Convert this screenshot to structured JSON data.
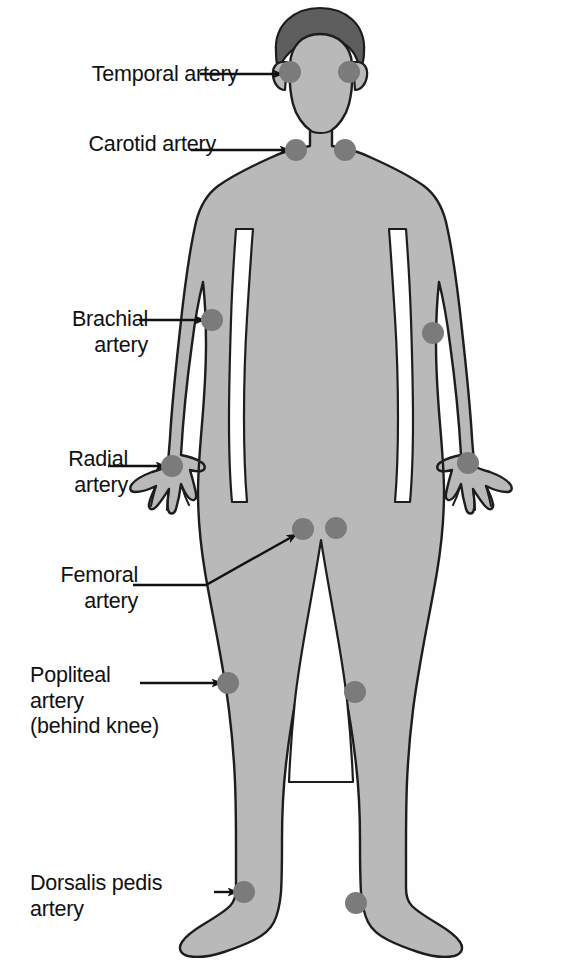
{
  "diagram": {
    "colors": {
      "background": "#fefefe",
      "skin": "#b9b9b9",
      "hair": "#5e5e5e",
      "outline": "#1d1d1d",
      "pulse_dot": "#7b7b7b",
      "text": "#111111",
      "leader_line": "#111111"
    },
    "labels": [
      {
        "id": "temporal",
        "lines": [
          "Temporal artery"
        ],
        "align": "right",
        "x": 30,
        "y": 62,
        "width": 208
      },
      {
        "id": "carotid",
        "lines": [
          "Carotid artery"
        ],
        "align": "right",
        "x": 30,
        "y": 132,
        "width": 186
      },
      {
        "id": "brachial",
        "lines": [
          "Brachial",
          "artery"
        ],
        "align": "right",
        "x": 18,
        "y": 307,
        "width": 130
      },
      {
        "id": "radial",
        "lines": [
          "Radial",
          "artery"
        ],
        "align": "right",
        "x": 18,
        "y": 447,
        "width": 110
      },
      {
        "id": "femoral",
        "lines": [
          "Femoral",
          "artery"
        ],
        "align": "right",
        "x": 18,
        "y": 563,
        "width": 120
      },
      {
        "id": "popliteal",
        "lines": [
          "Popliteal",
          "artery",
          "(behind knee)"
        ],
        "align": "left",
        "x": 30,
        "y": 663,
        "width": 190
      },
      {
        "id": "dorsalis_pedis",
        "lines": [
          "Dorsalis pedis",
          "artery"
        ],
        "align": "left",
        "x": 30,
        "y": 871,
        "width": 200
      }
    ],
    "pulse_points": [
      {
        "name": "temporal-left",
        "side": "left",
        "cx": 290,
        "cy": 72,
        "r": 11
      },
      {
        "name": "temporal-right",
        "side": "right",
        "cx": 349,
        "cy": 72,
        "r": 11
      },
      {
        "name": "carotid-left",
        "side": "left",
        "cx": 296,
        "cy": 150,
        "r": 11
      },
      {
        "name": "carotid-right",
        "side": "right",
        "cx": 345,
        "cy": 150,
        "r": 11
      },
      {
        "name": "brachial-left",
        "side": "left",
        "cx": 212,
        "cy": 320,
        "r": 11
      },
      {
        "name": "brachial-right",
        "side": "right",
        "cx": 433,
        "cy": 333,
        "r": 11
      },
      {
        "name": "radial-left",
        "side": "left",
        "cx": 172,
        "cy": 466,
        "r": 11
      },
      {
        "name": "radial-right",
        "side": "right",
        "cx": 468,
        "cy": 463,
        "r": 11
      },
      {
        "name": "femoral-left",
        "side": "left",
        "cx": 303,
        "cy": 529,
        "r": 11
      },
      {
        "name": "femoral-right",
        "side": "right",
        "cx": 336,
        "cy": 528,
        "r": 11
      },
      {
        "name": "popliteal-left",
        "side": "left",
        "cx": 228,
        "cy": 683,
        "r": 11
      },
      {
        "name": "popliteal-right",
        "side": "right",
        "cx": 355,
        "cy": 692,
        "r": 11
      },
      {
        "name": "dorsalis-pedis-left",
        "side": "left",
        "cx": 244,
        "cy": 892,
        "r": 11
      },
      {
        "name": "dorsalis-pedis-right",
        "side": "right",
        "cx": 356,
        "cy": 903,
        "r": 11
      }
    ],
    "leader_lines": [
      {
        "name": "temporal-leader",
        "type": "straight",
        "x1": 200,
        "y1": 74,
        "x2": 283,
        "y2": 74
      },
      {
        "name": "carotid-leader",
        "type": "straight",
        "x1": 191,
        "y1": 150,
        "x2": 290,
        "y2": 150
      },
      {
        "name": "brachial-leader",
        "type": "straight",
        "x1": 139,
        "y1": 320,
        "x2": 205,
        "y2": 320
      },
      {
        "name": "radial-leader",
        "type": "straight",
        "x1": 108,
        "y1": 466,
        "x2": 166,
        "y2": 466
      },
      {
        "name": "femoral-leader",
        "type": "elbow",
        "x1": 133,
        "y1": 585,
        "x2": 206,
        "y2": 585,
        "x3": 297,
        "y3": 534
      },
      {
        "name": "popliteal-leader",
        "type": "straight",
        "x1": 140,
        "y1": 683,
        "x2": 222,
        "y2": 683
      },
      {
        "name": "dorsalis-pedis-leader",
        "type": "straight",
        "x1": 214,
        "y1": 892,
        "x2": 238,
        "y2": 892
      }
    ]
  }
}
